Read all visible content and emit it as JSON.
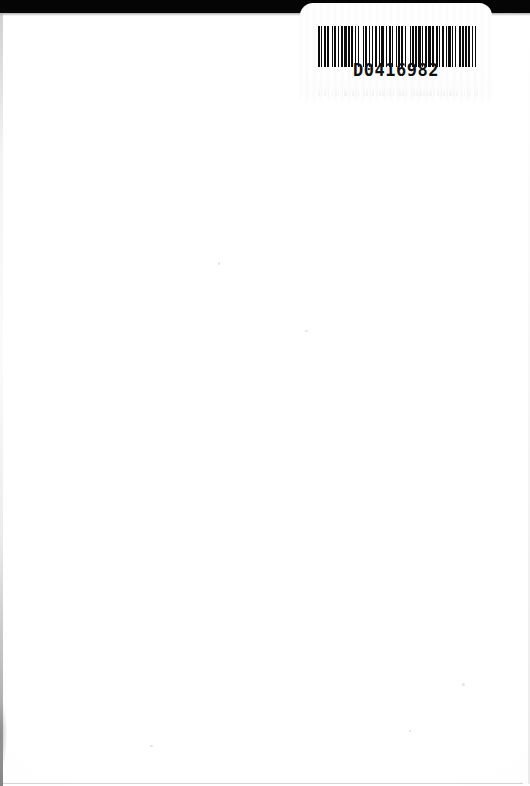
{
  "page": {
    "kind": "scanned-blank-page",
    "width": 530,
    "height": 786,
    "background_color": "#ffffff"
  },
  "scanner_band": {
    "name": "scanner-edge-band",
    "color": "#050505",
    "height_px": 13
  },
  "label": {
    "name": "barcode-label",
    "background_color": "#ffffff",
    "barcode": {
      "number": "D0416982",
      "symbology": "Code 39",
      "bar_color": "#0b0b0b",
      "pattern": [
        3,
        2,
        2,
        2,
        3,
        3,
        2,
        5,
        2,
        2,
        3,
        2,
        2,
        4,
        2,
        2,
        5,
        2,
        2,
        3,
        3,
        2,
        2,
        3,
        2,
        6,
        2,
        2,
        3,
        3,
        2,
        2,
        2,
        4,
        2,
        3,
        2,
        2,
        5,
        3,
        2,
        2,
        3,
        2,
        2,
        4,
        2,
        2,
        3,
        2,
        3,
        3,
        2,
        5,
        2,
        2,
        3,
        2,
        2,
        3,
        4,
        2,
        2,
        3,
        2,
        2,
        5,
        2,
        2,
        4,
        3,
        2,
        2,
        2,
        3,
        3,
        2,
        2,
        4,
        2,
        2,
        3,
        2,
        5,
        2,
        2,
        3,
        2,
        3,
        2,
        2,
        4,
        2,
        2,
        3,
        3
      ]
    }
  },
  "artifacts": {
    "edge_shadow_color": "#aaaaaa",
    "ghost_opacity": "0.085"
  }
}
